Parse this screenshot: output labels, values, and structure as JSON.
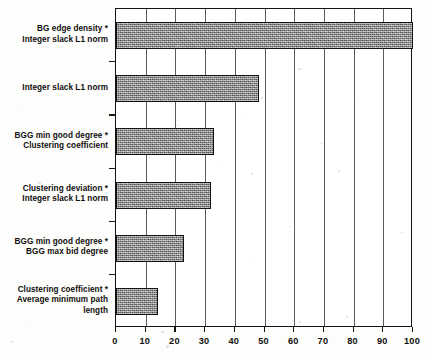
{
  "chart_data": {
    "type": "bar",
    "orientation": "horizontal",
    "title": "",
    "subtitle": "",
    "xlabel": "",
    "ylabel": "",
    "xlim": [
      0,
      100
    ],
    "ylim": null,
    "grid": true,
    "grid_axis": "x",
    "legend": false,
    "legend_position": "none",
    "bar_color": "#8d8d8b",
    "bar_edge_color": "#131211",
    "axis_color": "#15120f",
    "categories": [
      "BG edge density *\nInteger slack  L1 norm",
      "Integer slack L1 norm",
      "BGG min good degree *\nClustering coefficient",
      "Clustering deviation *\nInteger slack L1 norm",
      "BGG min good degree *\nBGG max bid degree",
      "Clustering coefficient *\nAverage minimum path\nlength"
    ],
    "values": [
      100,
      48,
      33,
      32,
      23,
      14
    ],
    "xticks": [
      0,
      10,
      20,
      30,
      40,
      50,
      60,
      70,
      80,
      90,
      100
    ],
    "xticklabels": [
      "0",
      "10",
      "20",
      "30",
      "40",
      "50",
      "60",
      "70",
      "80",
      "90",
      "100"
    ]
  }
}
